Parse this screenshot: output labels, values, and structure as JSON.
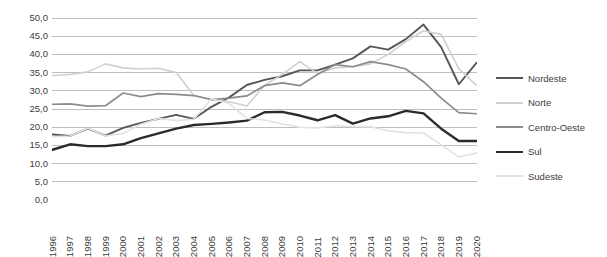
{
  "chart_data": {
    "type": "line",
    "title": "",
    "subtitle": "",
    "xlabel": "",
    "ylabel": "",
    "grid": true,
    "legend_position": "right",
    "ylim": [
      0,
      50
    ],
    "ytick_labels": [
      "50,0",
      "45,0",
      "40,0",
      "35,0",
      "30,0",
      "25,0",
      "20,0",
      "15,0",
      "10,0",
      "5,0",
      "0,0"
    ],
    "ytick_values": [
      50,
      45,
      40,
      35,
      30,
      25,
      20,
      15,
      10,
      5,
      0
    ],
    "categories": [
      "1996",
      "1997",
      "1998",
      "1999",
      "2000",
      "2001",
      "2002",
      "2003",
      "2004",
      "2005",
      "2006",
      "2007",
      "2008",
      "2009",
      "2010",
      "2011",
      "2012",
      "2013",
      "2014",
      "2015",
      "2016",
      "2017",
      "2018",
      "2019",
      "2020"
    ],
    "x": [
      1996,
      1997,
      1998,
      1999,
      2000,
      2001,
      2002,
      2003,
      2004,
      2005,
      2006,
      2007,
      2008,
      2009,
      2010,
      2011,
      2012,
      2013,
      2014,
      2015,
      2016,
      2017,
      2018,
      2019,
      2020
    ],
    "series": [
      {
        "name": "Nordeste",
        "color": "#575757",
        "width": 1.9,
        "values": [
          18.0,
          17.6,
          19.6,
          17.7,
          19.8,
          21.2,
          22.3,
          23.4,
          22.3,
          25.6,
          28.2,
          31.6,
          33.0,
          34.0,
          35.6,
          35.6,
          37.2,
          38.9,
          42.2,
          41.3,
          44.2,
          48.2,
          42.0,
          31.8,
          37.7
        ]
      },
      {
        "name": "Norte",
        "color": "#d0d0d0",
        "width": 1.6,
        "values": [
          34.2,
          34.5,
          35.2,
          37.4,
          36.3,
          36.0,
          36.2,
          35.0,
          28.7,
          27.5,
          27.0,
          25.8,
          31.5,
          34.5,
          38.0,
          34.8,
          36.3,
          36.6,
          37.4,
          40.0,
          43.5,
          46.5,
          45.5,
          36.0,
          31.5
        ]
      },
      {
        "name": "Centro-Oeste",
        "color": "#8c8c8c",
        "width": 1.7,
        "values": [
          26.3,
          26.4,
          25.8,
          25.9,
          29.4,
          28.4,
          29.2,
          29.0,
          28.7,
          27.6,
          28.0,
          28.6,
          31.4,
          32.2,
          31.4,
          34.5,
          37.2,
          36.6,
          38.0,
          37.2,
          36.0,
          32.5,
          28.0,
          24.0,
          23.7
        ]
      },
      {
        "name": "Sul",
        "color": "#2b2b2b",
        "width": 2.4,
        "values": [
          13.8,
          15.3,
          14.8,
          14.8,
          15.3,
          17.0,
          18.3,
          19.6,
          20.6,
          20.9,
          21.3,
          21.8,
          24.1,
          24.2,
          23.2,
          21.9,
          23.3,
          21.0,
          22.4,
          23.0,
          24.5,
          23.8,
          19.6,
          16.2,
          16.2
        ]
      },
      {
        "name": "Sudeste",
        "color": "#e2e2e2",
        "width": 1.6,
        "values": [
          17.4,
          17.6,
          19.7,
          17.6,
          18.3,
          20.8,
          22.4,
          21.8,
          22.2,
          27.8,
          26.5,
          22.4,
          22.0,
          20.9,
          20.0,
          19.8,
          20.4,
          20.2,
          20.1,
          19.0,
          18.5,
          18.4,
          15.2,
          11.8,
          12.9
        ]
      }
    ]
  },
  "legend": {
    "items": [
      {
        "label": "Nordeste"
      },
      {
        "label": "Norte"
      },
      {
        "label": "Centro-Oeste"
      },
      {
        "label": "Sul"
      },
      {
        "label": "Sudeste"
      }
    ]
  },
  "style": {
    "grid_color": "#bfbfbf",
    "text_color": "#3c3c3c",
    "background": "#ffffff"
  }
}
